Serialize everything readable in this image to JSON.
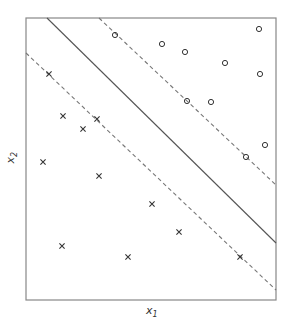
{
  "figure": {
    "xlabel": "x",
    "xlabel_sub": "1",
    "ylabel": "x",
    "ylabel_sub": "2",
    "colors": {
      "axes": "#888888",
      "points": "#333333",
      "solid_line": "#555555",
      "dashed_line": "#777777"
    }
  },
  "plot_area": {
    "left": 26,
    "top": 18,
    "right": 276,
    "bottom": 300
  },
  "lines": {
    "hyperplane": {
      "x1": 47,
      "y1": 18,
      "x2": 276,
      "y2": 243,
      "style": "solid"
    },
    "margin_upper": {
      "x1": 99,
      "y1": 18,
      "x2": 276,
      "y2": 185,
      "style": "dashed"
    },
    "margin_lower": {
      "x1": 26,
      "y1": 53,
      "x2": 276,
      "y2": 290,
      "style": "dashed"
    }
  },
  "class_o": [
    [
      115,
      35
    ],
    [
      162,
      44
    ],
    [
      185,
      52
    ],
    [
      225,
      63
    ],
    [
      259,
      29
    ],
    [
      260,
      74
    ],
    [
      187,
      101
    ],
    [
      211,
      102
    ],
    [
      265,
      145
    ],
    [
      246,
      157
    ]
  ],
  "class_x": [
    [
      49,
      74
    ],
    [
      63,
      116
    ],
    [
      83,
      129
    ],
    [
      97,
      119
    ],
    [
      43,
      162
    ],
    [
      99,
      176
    ],
    [
      152,
      204
    ],
    [
      179,
      232
    ],
    [
      62,
      246
    ],
    [
      128,
      257
    ],
    [
      240,
      257
    ]
  ]
}
